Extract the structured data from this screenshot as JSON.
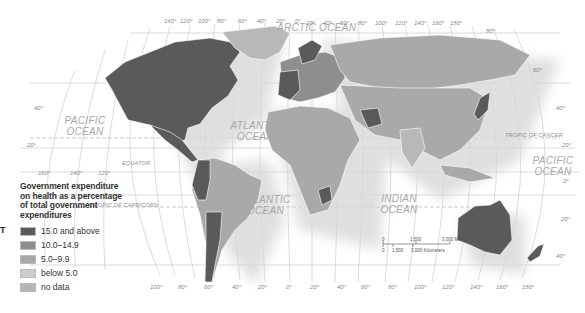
{
  "legend": {
    "title": "Government expenditure on health as a percentage of total government expenditures",
    "items": [
      {
        "label": "15.0 and above",
        "color": "#5a5a5a"
      },
      {
        "label": "10.0–14.9",
        "color": "#8e8e8e"
      },
      {
        "label": "5.0–9.9",
        "color": "#a9a9a9"
      },
      {
        "label": "below 5.0",
        "color": "#cdcdcd"
      },
      {
        "label": "no data",
        "color": "#b5b5b5"
      }
    ]
  },
  "side_text": "T",
  "oceans": {
    "arctic": "ARCTIC OCEAN",
    "pacific_west": "PACIFIC OCEAN",
    "pacific_east": "PACIFIC OCEAN",
    "atlantic_north": "ATLANTIC OCEAN",
    "atlantic_south": "ATLANTIC OCEAN",
    "indian": "INDIAN OCEAN"
  },
  "reference_lines": {
    "equator": "EQUATOR",
    "tropic_cancer": "TROPIC OF CANCER",
    "tropic_capricorn": "TROPIC OF CAPRICORN"
  },
  "top_longitudes": [
    "140°",
    "120°",
    "100°",
    "80°",
    "60°",
    "40°",
    "20°",
    "0°",
    "20°",
    "40°",
    "60°",
    "80°",
    "100°",
    "120°",
    "140°",
    "160°",
    "180°"
  ],
  "bottom_longitudes": [
    "100°",
    "80°",
    "60°",
    "40°",
    "20°",
    "0°",
    "20°",
    "40°",
    "60°",
    "80°",
    "100°",
    "120°",
    "140°",
    "160°",
    "180°"
  ],
  "pacific_longitudes": [
    "160°",
    "140°",
    "120°"
  ],
  "left_latitudes": [
    "40°",
    "20°"
  ],
  "right_latitudes": [
    "80°",
    "60°",
    "40°",
    "20°",
    "0°",
    "20°",
    "40°"
  ],
  "scale_bar": {
    "miles_ticks": [
      "0",
      "1,500",
      "3,000 Miles"
    ],
    "km_ticks": [
      "0",
      "1,500",
      "3,000 Kilometers"
    ]
  }
}
